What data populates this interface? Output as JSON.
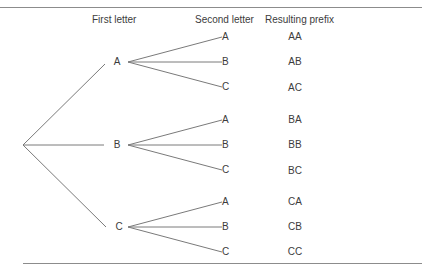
{
  "headers": {
    "first": "First letter",
    "second": "Second letter",
    "prefix": "Resulting prefix"
  },
  "colors": {
    "line": "#7a7a7a",
    "rule": "#8c8c8c",
    "text": "#3c3c3c"
  },
  "first_letters": [
    {
      "label": "A",
      "second": [
        "A",
        "B",
        "C"
      ],
      "prefixes": [
        "AA",
        "AB",
        "AC"
      ]
    },
    {
      "label": "B",
      "second": [
        "A",
        "B",
        "C"
      ],
      "prefixes": [
        "BA",
        "BB",
        "BC"
      ]
    },
    {
      "label": "C",
      "second": [
        "A",
        "B",
        "C"
      ],
      "prefixes": [
        "CA",
        "CB",
        "CC"
      ]
    }
  ]
}
